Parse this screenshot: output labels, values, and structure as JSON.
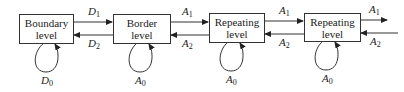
{
  "diagram": {
    "type": "state-transition",
    "nodes": [
      {
        "id": "boundary",
        "line1": "Boundary",
        "line2": "level",
        "self_loop": {
          "sym": "D",
          "sub": "0"
        }
      },
      {
        "id": "border",
        "line1": "Border",
        "line2": "level",
        "self_loop": {
          "sym": "A",
          "sub": "0"
        }
      },
      {
        "id": "repeating1",
        "line1": "Repeating",
        "line2": "level",
        "self_loop": {
          "sym": "A",
          "sub": "0"
        }
      },
      {
        "id": "repeating2",
        "line1": "Repeating",
        "line2": "level",
        "self_loop": {
          "sym": "A",
          "sub": "0"
        }
      }
    ],
    "edges": [
      {
        "from": "boundary",
        "to": "border",
        "sym": "D",
        "sub": "1"
      },
      {
        "from": "border",
        "to": "boundary",
        "sym": "D",
        "sub": "2"
      },
      {
        "from": "border",
        "to": "repeating1",
        "sym": "A",
        "sub": "1"
      },
      {
        "from": "repeating1",
        "to": "border",
        "sym": "A",
        "sub": "2"
      },
      {
        "from": "repeating1",
        "to": "repeating2",
        "sym": "A",
        "sub": "1"
      },
      {
        "from": "repeating2",
        "to": "repeating1",
        "sym": "A",
        "sub": "2"
      },
      {
        "from": "repeating2",
        "to": "outside",
        "sym": "A",
        "sub": "1"
      },
      {
        "from": "outside",
        "to": "repeating2",
        "sym": "A",
        "sub": "2"
      }
    ],
    "colors": {
      "stroke": "#333333",
      "text": "#222222",
      "background": "#ffffff"
    }
  }
}
